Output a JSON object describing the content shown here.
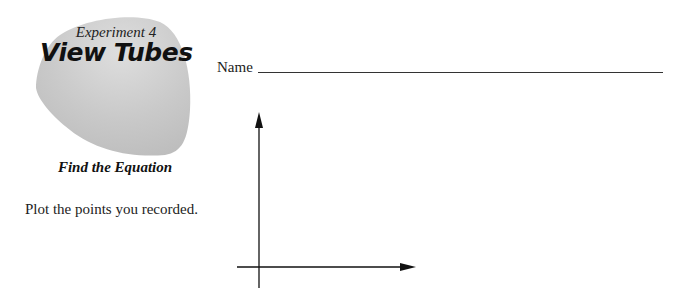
{
  "header": {
    "experiment_label": "Experiment 4",
    "title": "View Tubes",
    "subtitle": "Find the Equation"
  },
  "name_field": {
    "label": "Name",
    "value": ""
  },
  "instructions": {
    "text": "Plot the points you recorded."
  },
  "graph": {
    "type": "blank-axes",
    "x_axis_arrow": true,
    "y_axis_arrow": true,
    "data_points": []
  },
  "colors": {
    "blob_fill": "#c9c9c9",
    "blob_highlight": "#dcdcdc",
    "text": "#1a1a1a",
    "axis": "#111111"
  }
}
